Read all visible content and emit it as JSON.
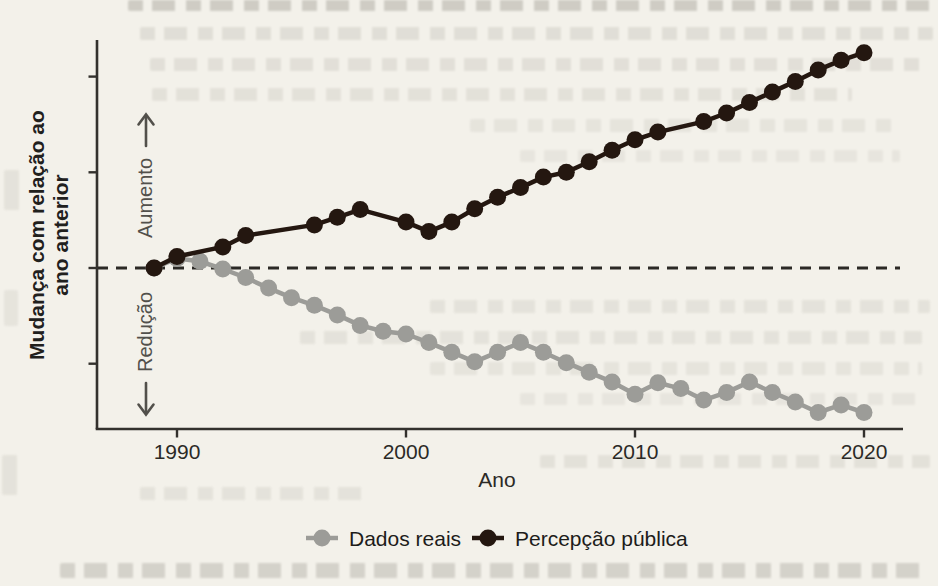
{
  "page": {
    "background_color": "#f3f1ea",
    "description_colors": {
      "axis": "#33312d",
      "zero_line": "#2b2925",
      "text": "#2b2a26"
    }
  },
  "chart_data": {
    "type": "line",
    "title": "",
    "xlabel": "Ano",
    "ylabel": "Mudança com relação ao ano anterior",
    "ylabel_lines": {
      "line1": "Mudança com relação ao",
      "line2": "ano anterior"
    },
    "direction_annotations": {
      "up": "Aumento",
      "down": "Redução"
    },
    "x_ticks": [
      "1990",
      "2000",
      "2010",
      "2020"
    ],
    "x_tick_values": [
      1990,
      2000,
      2010,
      2020
    ],
    "x_range": [
      1986.5,
      2021.7
    ],
    "y_ticks_values": [
      2,
      1,
      0,
      -1
    ],
    "ylim": [
      -1.68,
      2.38
    ],
    "y_tick_labels_shown": false,
    "grid": false,
    "zero_line": {
      "value": 0,
      "style": "dashed"
    },
    "legend_position": "bottom",
    "series": [
      {
        "name": "Dados reais",
        "color": "#9c9c98",
        "points": [
          [
            1989,
            0.0
          ],
          [
            1990,
            0.1
          ],
          [
            1991,
            0.07
          ],
          [
            1992,
            -0.01
          ],
          [
            1993,
            -0.1
          ],
          [
            1994,
            -0.21
          ],
          [
            1995,
            -0.31
          ],
          [
            1996,
            -0.39
          ],
          [
            1997,
            -0.49
          ],
          [
            1998,
            -0.6
          ],
          [
            1999,
            -0.66
          ],
          [
            2000,
            -0.69
          ],
          [
            2001,
            -0.78
          ],
          [
            2002,
            -0.88
          ],
          [
            2003,
            -0.98
          ],
          [
            2004,
            -0.88
          ],
          [
            2005,
            -0.78
          ],
          [
            2006,
            -0.88
          ],
          [
            2007,
            -0.99
          ],
          [
            2008,
            -1.09
          ],
          [
            2009,
            -1.19
          ],
          [
            2010,
            -1.32
          ],
          [
            2011,
            -1.2
          ],
          [
            2012,
            -1.26
          ],
          [
            2013,
            -1.38
          ],
          [
            2014,
            -1.3
          ],
          [
            2015,
            -1.19
          ],
          [
            2016,
            -1.3
          ],
          [
            2017,
            -1.4
          ],
          [
            2018,
            -1.51
          ],
          [
            2019,
            -1.43
          ],
          [
            2020,
            -1.51
          ]
        ]
      },
      {
        "name": "Percepção pública",
        "color": "#241710",
        "points": [
          [
            1989,
            0.0
          ],
          [
            1990,
            0.12
          ],
          [
            1992,
            0.22
          ],
          [
            1993,
            0.34
          ],
          [
            1996,
            0.45
          ],
          [
            1997,
            0.53
          ],
          [
            1998,
            0.61
          ],
          [
            2000,
            0.48
          ],
          [
            2001,
            0.38
          ],
          [
            2002,
            0.48
          ],
          [
            2003,
            0.62
          ],
          [
            2004,
            0.74
          ],
          [
            2005,
            0.84
          ],
          [
            2006,
            0.95
          ],
          [
            2007,
            1.0
          ],
          [
            2008,
            1.11
          ],
          [
            2009,
            1.23
          ],
          [
            2010,
            1.34
          ],
          [
            2011,
            1.42
          ],
          [
            2013,
            1.53
          ],
          [
            2014,
            1.62
          ],
          [
            2015,
            1.73
          ],
          [
            2016,
            1.84
          ],
          [
            2017,
            1.95
          ],
          [
            2018,
            2.07
          ],
          [
            2019,
            2.17
          ],
          [
            2020,
            2.25
          ]
        ]
      }
    ]
  },
  "legend": {
    "items": [
      {
        "label": "Dados reais",
        "marker": "circle-on-line",
        "color": "#9c9c98"
      },
      {
        "label": "Percepção pública",
        "marker": "circle-on-line",
        "color": "#241710"
      }
    ]
  }
}
